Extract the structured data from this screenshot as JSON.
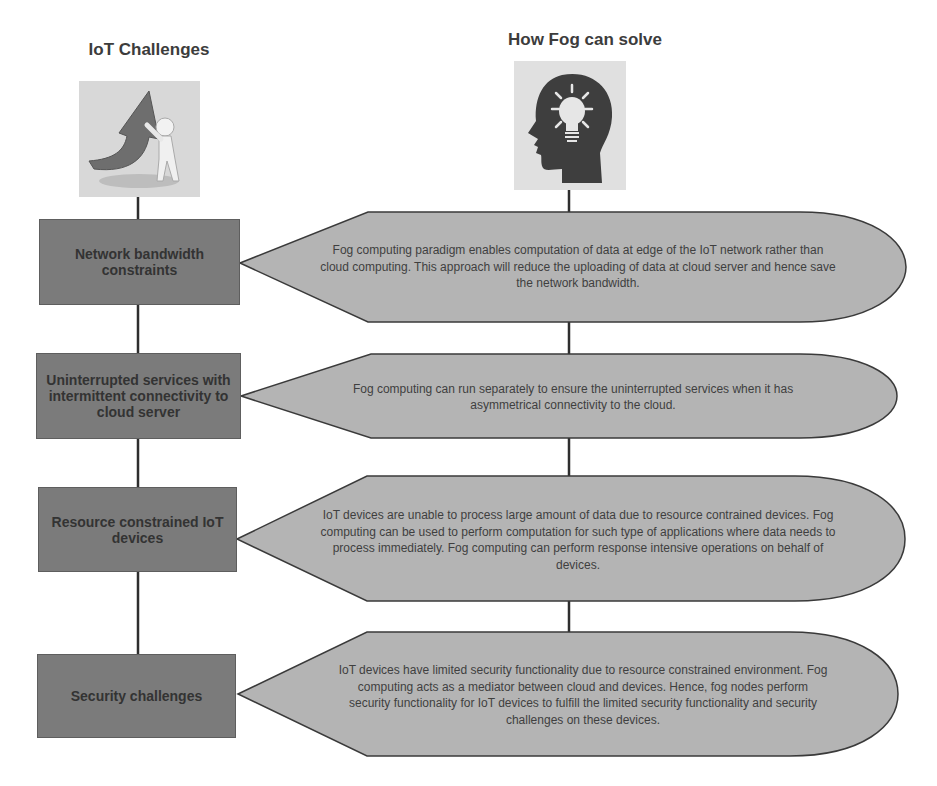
{
  "headers": {
    "left": "IoT Challenges",
    "right": "How Fog can solve"
  },
  "images": {
    "left": "person-pushing-arrow-icon",
    "right": "head-lightbulb-icon"
  },
  "colors": {
    "challenge_box_fill": "#7b7b7b",
    "solution_callout_fill": "#b4b4b4",
    "connector": "#2e2e2e",
    "text": "#3a3a3a"
  },
  "rows": [
    {
      "challenge": "Network bandwidth constraints",
      "solution": "Fog computing paradigm enables computation of data at edge of the IoT network rather than cloud computing. This approach will reduce the uploading of data at cloud server and hence save the network bandwidth."
    },
    {
      "challenge": "Uninterrupted services with intermittent connectivity to cloud server",
      "solution": "Fog computing can run separately to ensure the uninterrupted services when it has asymmetrical connectivity to the cloud."
    },
    {
      "challenge": "Resource constrained IoT devices",
      "solution": "IoT devices are unable to process large amount of data due to resource contrained devices. Fog computing can be used to perform computation for such type of applications where data needs to process immediately. Fog computing can perform response intensive operations on behalf of devices."
    },
    {
      "challenge": "Security challenges",
      "solution": "IoT devices have limited security functionality due to resource constrained environment. Fog computing acts as a mediator between cloud and devices. Hence, fog nodes perform security functionality for IoT devices to fulfill the limited security functionality and security challenges on these devices."
    }
  ]
}
